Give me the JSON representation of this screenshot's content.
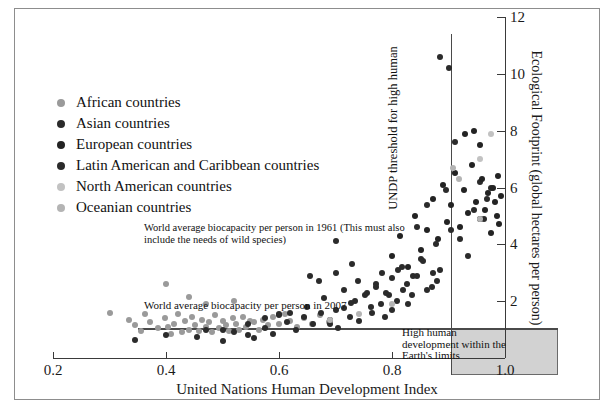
{
  "chart_data": {
    "type": "scatter",
    "title": "",
    "xlabel": "United Nations Human Development Index",
    "ylabel": "Ecological Footprint (global hectares per person)",
    "xlim": [
      0.2,
      1.0
    ],
    "ylim": [
      0,
      12
    ],
    "xticks": [
      "0.2",
      "0.4",
      "0.6",
      "0.8",
      "1.0"
    ],
    "xtick_values": [
      0.2,
      0.4,
      0.6,
      0.8,
      1.0
    ],
    "yticks": [
      "2",
      "4",
      "6",
      "8",
      "10",
      "12"
    ],
    "ytick_values": [
      2,
      4,
      6,
      8,
      10,
      12
    ],
    "grid": false,
    "legend_position": "upper-left",
    "annotations": [
      {
        "name": "biocapacity-1961",
        "text": "World average biocapacity per person in 1961  (This must also include the needs of wild species)"
      },
      {
        "name": "biocapacity-2007",
        "text": "World average biocapacity per person in 2007"
      },
      {
        "name": "undp-threshold",
        "text": "UNDP threshold for high human"
      },
      {
        "name": "high-human-development",
        "text": "High human development within the Earth's limits"
      }
    ],
    "reference_lines": [
      {
        "name": "biocapacity-2007-line",
        "orientation": "horizontal",
        "value": 1.8
      },
      {
        "name": "undp-threshold-line",
        "orientation": "vertical",
        "value": 0.8
      }
    ],
    "shaded_region": {
      "name": "high-human-development-zone",
      "x_from": 0.8,
      "x_to": 1.0,
      "y_from": 0,
      "y_to": 1.8,
      "color": "#d2d2d2"
    },
    "series": [
      {
        "name": "African countries",
        "color": "#9a9a9a",
        "points": [
          [
            0.355,
            0.95
          ],
          [
            0.372,
            1.25
          ],
          [
            0.386,
            1.05
          ],
          [
            0.398,
            1.4
          ],
          [
            0.404,
            1.1
          ],
          [
            0.409,
            0.85
          ],
          [
            0.415,
            1.2
          ],
          [
            0.421,
            1.55
          ],
          [
            0.428,
            0.9
          ],
          [
            0.433,
            1.3
          ],
          [
            0.44,
            1.0
          ],
          [
            0.446,
            1.45
          ],
          [
            0.452,
            1.15
          ],
          [
            0.458,
            0.95
          ],
          [
            0.463,
            1.35
          ],
          [
            0.47,
            1.1
          ],
          [
            0.476,
            1.25
          ],
          [
            0.482,
            0.9
          ],
          [
            0.487,
            1.5
          ],
          [
            0.494,
            1.05
          ],
          [
            0.5,
            1.3
          ],
          [
            0.506,
            1.15
          ],
          [
            0.512,
            0.95
          ],
          [
            0.518,
            1.4
          ],
          [
            0.524,
            1.2
          ],
          [
            0.53,
            1.0
          ],
          [
            0.536,
            1.45
          ],
          [
            0.542,
            1.1
          ],
          [
            0.548,
            1.3
          ],
          [
            0.556,
            1.25
          ],
          [
            0.564,
            1.0
          ],
          [
            0.572,
            1.35
          ],
          [
            0.58,
            1.15
          ],
          [
            0.59,
            1.45
          ],
          [
            0.6,
            1.2
          ],
          [
            0.61,
            1.55
          ],
          [
            0.62,
            1.3
          ],
          [
            0.632,
            1.1
          ],
          [
            0.645,
            1.4
          ],
          [
            0.658,
            1.2
          ],
          [
            0.672,
            1.5
          ],
          [
            0.688,
            1.25
          ],
          [
            0.4,
            2.6
          ],
          [
            0.44,
            2.15
          ],
          [
            0.47,
            1.9
          ],
          [
            0.52,
            2.0
          ],
          [
            0.3,
            1.6
          ],
          [
            0.335,
            1.35
          ],
          [
            0.345,
            1.15
          ],
          [
            0.363,
            1.55
          ]
        ]
      },
      {
        "name": "Asian countries",
        "color": "#2b2b2b",
        "points": [
          [
            0.345,
            0.65
          ],
          [
            0.4,
            0.8
          ],
          [
            0.455,
            0.75
          ],
          [
            0.47,
            1.0
          ],
          [
            0.5,
            0.6
          ],
          [
            0.52,
            0.9
          ],
          [
            0.545,
            0.8
          ],
          [
            0.555,
            0.7
          ],
          [
            0.575,
            1.05
          ],
          [
            0.59,
            0.85
          ],
          [
            0.6,
            1.5
          ],
          [
            0.615,
            1.25
          ],
          [
            0.63,
            1.0
          ],
          [
            0.645,
            1.45
          ],
          [
            0.66,
            1.2
          ],
          [
            0.675,
            1.6
          ],
          [
            0.69,
            1.35
          ],
          [
            0.705,
            1.05
          ],
          [
            0.715,
            1.75
          ],
          [
            0.725,
            1.45
          ],
          [
            0.735,
            2.0
          ],
          [
            0.742,
            1.3
          ],
          [
            0.755,
            2.3
          ],
          [
            0.765,
            1.6
          ],
          [
            0.772,
            2.6
          ],
          [
            0.78,
            1.9
          ],
          [
            0.788,
            1.45
          ],
          [
            0.795,
            2.2
          ],
          [
            0.8,
            1.7
          ],
          [
            0.81,
            3.1
          ],
          [
            0.82,
            2.4
          ],
          [
            0.828,
            1.9
          ],
          [
            0.838,
            2.9
          ],
          [
            0.845,
            4.6
          ],
          [
            0.855,
            3.4
          ],
          [
            0.862,
            5.4
          ],
          [
            0.87,
            2.5
          ],
          [
            0.878,
            4.0
          ],
          [
            0.885,
            3.1
          ],
          [
            0.895,
            5.9
          ],
          [
            0.905,
            4.5
          ],
          [
            0.912,
            7.6
          ],
          [
            0.92,
            4.2
          ],
          [
            0.935,
            3.6
          ],
          [
            0.945,
            5.2
          ],
          [
            0.955,
            6.2
          ],
          [
            0.962,
            4.9
          ],
          [
            0.968,
            5.6
          ],
          [
            0.975,
            6.0
          ],
          [
            0.73,
            3.3
          ],
          [
            0.67,
            2.7
          ],
          [
            0.7,
            4.1
          ],
          [
            0.885,
            10.6
          ],
          [
            0.9,
            10.2
          ]
        ]
      },
      {
        "name": "European countries",
        "color": "#232323",
        "points": [
          [
            0.8,
            3.6
          ],
          [
            0.815,
            4.3
          ],
          [
            0.828,
            3.2
          ],
          [
            0.84,
            5.0
          ],
          [
            0.852,
            3.8
          ],
          [
            0.862,
            4.5
          ],
          [
            0.872,
            5.6
          ],
          [
            0.882,
            4.2
          ],
          [
            0.89,
            6.1
          ],
          [
            0.898,
            4.8
          ],
          [
            0.905,
            5.4
          ],
          [
            0.912,
            6.5
          ],
          [
            0.92,
            4.6
          ],
          [
            0.928,
            5.9
          ],
          [
            0.935,
            5.1
          ],
          [
            0.942,
            6.8
          ],
          [
            0.948,
            5.5
          ],
          [
            0.955,
            4.9
          ],
          [
            0.96,
            6.3
          ],
          [
            0.965,
            5.2
          ],
          [
            0.97,
            5.8
          ],
          [
            0.975,
            4.4
          ],
          [
            0.978,
            6.0
          ],
          [
            0.982,
            5.5
          ],
          [
            0.985,
            5.0
          ],
          [
            0.988,
            6.4
          ],
          [
            0.99,
            4.7
          ],
          [
            0.993,
            5.7
          ],
          [
            0.945,
            8.0
          ],
          [
            0.955,
            7.5
          ],
          [
            0.93,
            7.9
          ]
        ]
      },
      {
        "name": "Latin American and Caribbean countries",
        "color": "#2b2b2b",
        "points": [
          [
            0.62,
            1.6
          ],
          [
            0.65,
            1.8
          ],
          [
            0.68,
            2.1
          ],
          [
            0.7,
            1.7
          ],
          [
            0.715,
            2.4
          ],
          [
            0.728,
            1.95
          ],
          [
            0.74,
            2.7
          ],
          [
            0.752,
            2.2
          ],
          [
            0.762,
            1.8
          ],
          [
            0.772,
            2.5
          ],
          [
            0.782,
            3.0
          ],
          [
            0.79,
            2.3
          ],
          [
            0.8,
            2.8
          ],
          [
            0.808,
            2.0
          ],
          [
            0.818,
            3.2
          ],
          [
            0.826,
            2.6
          ],
          [
            0.835,
            2.2
          ],
          [
            0.845,
            2.9
          ],
          [
            0.852,
            3.5
          ],
          [
            0.862,
            2.4
          ],
          [
            0.872,
            3.0
          ],
          [
            0.88,
            2.7
          ],
          [
            0.575,
            1.4
          ],
          [
            0.6,
            1.55
          ],
          [
            0.545,
            1.2
          ],
          [
            0.5,
            1.0
          ],
          [
            0.655,
            2.9
          ],
          [
            0.7,
            3.0
          ],
          [
            0.69,
            1.2
          ]
        ]
      },
      {
        "name": "North American countries",
        "color": "#c2c2c2",
        "points": [
          [
            0.955,
            7.0
          ],
          [
            0.975,
            7.9
          ]
        ]
      },
      {
        "name": "Oceanian countries",
        "color": "#b4b4b4",
        "points": [
          [
            0.908,
            6.7
          ],
          [
            0.918,
            6.3
          ],
          [
            0.8,
            1.9
          ],
          [
            0.742,
            1.55
          ],
          [
            0.69,
            1.35
          ],
          [
            0.955,
            4.9
          ]
        ]
      }
    ]
  },
  "legend": {
    "items": [
      {
        "label": "African countries",
        "color": "#9a9a9a"
      },
      {
        "label": "Asian countries",
        "color": "#2b2b2b"
      },
      {
        "label": "European countries",
        "color": "#232323"
      },
      {
        "label": "Latin American and Caribbean countries",
        "color": "#2b2b2b"
      },
      {
        "label": "North American countries",
        "color": "#c2c2c2"
      },
      {
        "label": "Oceanian countries",
        "color": "#b4b4b4"
      }
    ]
  },
  "annotations_text": {
    "bio1961": "World average biocapacity per person in 1961  (This must also include the needs of wild species)",
    "bio2007": "World average biocapacity per person in 2007",
    "undp": "UNDP threshold for high human",
    "hhd": "High human development within the Earth's limits"
  }
}
